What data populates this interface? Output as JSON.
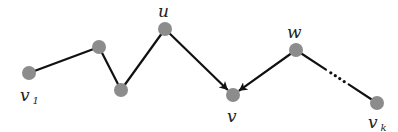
{
  "diagram": {
    "type": "path-graph",
    "nodes": [
      {
        "id": "v1",
        "label": "v",
        "subscript": "1"
      },
      {
        "id": "a",
        "label": ""
      },
      {
        "id": "b",
        "label": ""
      },
      {
        "id": "u",
        "label": "u",
        "subscript": ""
      },
      {
        "id": "v",
        "label": "v",
        "subscript": ""
      },
      {
        "id": "w",
        "label": "w",
        "subscript": ""
      },
      {
        "id": "vk",
        "label": "v",
        "subscript": "k"
      }
    ],
    "edges": [
      {
        "from": "v1",
        "to": "a",
        "directed": false,
        "style": "solid"
      },
      {
        "from": "a",
        "to": "b",
        "directed": false,
        "style": "solid"
      },
      {
        "from": "b",
        "to": "u",
        "directed": false,
        "style": "solid"
      },
      {
        "from": "u",
        "to": "v",
        "directed": true,
        "style": "solid"
      },
      {
        "from": "w",
        "to": "v",
        "directed": true,
        "style": "solid"
      },
      {
        "from": "w",
        "to": "vk",
        "directed": false,
        "style": "ellipsis",
        "ellipsis": "..."
      }
    ]
  }
}
